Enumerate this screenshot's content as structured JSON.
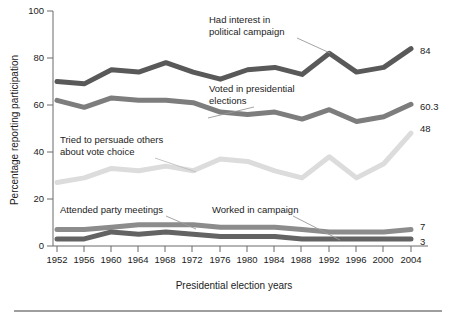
{
  "chart_data": {
    "type": "line",
    "title": "",
    "xlabel": "Presidential election years",
    "ylabel": "Percentage reporting participation",
    "ylim": [
      0,
      100
    ],
    "yticks": [
      0,
      20,
      40,
      60,
      80,
      100
    ],
    "ytick_labels": [
      "0",
      "20",
      "40",
      "60",
      "80",
      "100"
    ],
    "grid": false,
    "legend_position": "inline-annotations",
    "categories": [
      1952,
      1956,
      1960,
      1964,
      1968,
      1972,
      1976,
      1980,
      1984,
      1988,
      1992,
      1996,
      2000,
      2004
    ],
    "xtick_labels": [
      "1952",
      "1956",
      "1960",
      "1964",
      "1968",
      "1972",
      "1976",
      "1980",
      "1984",
      "1988",
      "1992",
      "1996",
      "2000",
      "2004"
    ],
    "series": [
      {
        "name": "Had interest in political campaign",
        "color": "#595959",
        "end_label": "84",
        "values": [
          70,
          69,
          75,
          74,
          78,
          74,
          71,
          75,
          76,
          73,
          82,
          74,
          76,
          84
        ]
      },
      {
        "name": "Voted in presidential elections",
        "color": "#7d7d7d",
        "end_label": "60.3",
        "values": [
          62,
          59,
          63,
          62,
          62,
          61,
          57,
          56,
          57,
          54,
          58,
          53,
          55,
          60.3
        ]
      },
      {
        "name": "Tried to persuade others about vote choice",
        "color": "#dcdcdc",
        "end_label": "48",
        "values": [
          27,
          29,
          33,
          32,
          34,
          32,
          37,
          36,
          32,
          29,
          38,
          29,
          35,
          48
        ]
      },
      {
        "name": "Attended party meetings",
        "color": "#8c8c8c",
        "end_label": "7",
        "values": [
          7,
          7,
          8,
          9,
          9,
          9,
          8,
          8,
          8,
          7,
          6,
          6,
          6,
          7
        ]
      },
      {
        "name": "Worked in campaign",
        "color": "#636363",
        "end_label": "3",
        "values": [
          3,
          3,
          6,
          5,
          6,
          5,
          4,
          4,
          4,
          3,
          3,
          3,
          3,
          3
        ]
      }
    ],
    "annotations": [
      {
        "id": "had-interest",
        "lines": [
          "Had interest in",
          "political campaign"
        ]
      },
      {
        "id": "voted-presidential",
        "lines": [
          "Voted in presidential",
          "elections"
        ]
      },
      {
        "id": "tried-persuade",
        "lines": [
          "Tried to persuade others",
          "about vote choice"
        ]
      },
      {
        "id": "attended-meetings",
        "lines": [
          "Attended party meetings"
        ]
      },
      {
        "id": "worked-campaign",
        "lines": [
          "Worked in campaign"
        ]
      }
    ]
  }
}
